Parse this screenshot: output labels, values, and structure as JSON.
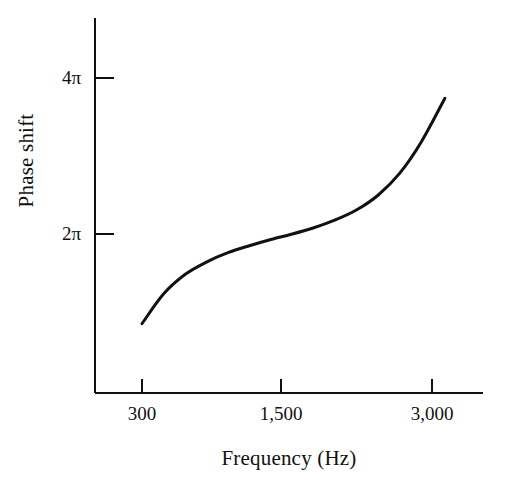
{
  "figure": {
    "background_color": "#ffffff",
    "ink_color": "#111111"
  },
  "axes": {
    "x_axis_label": "Frequency (Hz)",
    "y_axis_label": "Phase shift",
    "x_tick_labels": [
      "300",
      "1,500",
      "3,000"
    ],
    "y_tick_labels": [
      "2π",
      "4π"
    ]
  },
  "chart_data": {
    "type": "line",
    "title": "",
    "subtitle": "",
    "xlabel": "Frequency (Hz)",
    "ylabel": "Phase shift",
    "xlim": [
      0,
      3360
    ],
    "ylim": [
      0,
      4.9
    ],
    "x_ticks": [
      300,
      1500,
      3000
    ],
    "x_tick_labels": [
      "300",
      "1,500",
      "3,000"
    ],
    "y_ticks": [
      2,
      4
    ],
    "y_tick_labels": [
      "2π",
      "4π"
    ],
    "y_unit": "pi radians",
    "grid": false,
    "legend": null,
    "legend_position": "none",
    "annotations": [],
    "series": [
      {
        "name": "Phase shift",
        "color": "#111111",
        "line_width": 3,
        "x": [
          300,
          500,
          700,
          900,
          1100,
          1300,
          1500,
          1700,
          1900,
          2100,
          2300,
          2500,
          2700,
          2900,
          3120
        ],
        "y": [
          0.85,
          1.23,
          1.48,
          1.64,
          1.76,
          1.85,
          1.93,
          2.0,
          2.08,
          2.18,
          2.31,
          2.5,
          2.78,
          3.18,
          3.74
        ]
      }
    ]
  }
}
